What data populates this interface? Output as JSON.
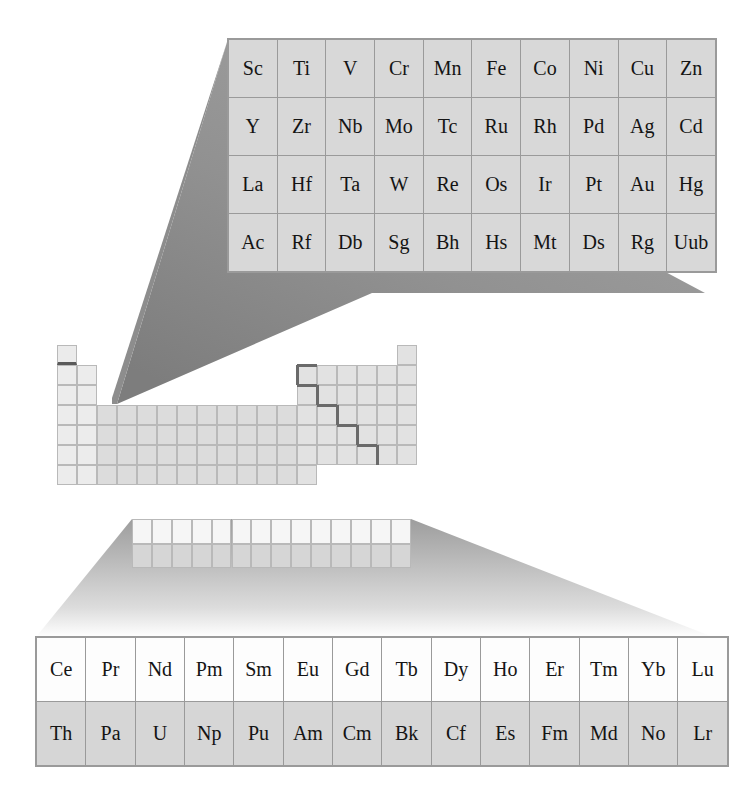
{
  "figure": {
    "kind": "periodic-table-callout-diagram",
    "background_color": "#ffffff",
    "cone_color_top": "#8d8d8d",
    "cone_color_bottom": "#b5b5b5",
    "cell_border_color": "#9a9a9a",
    "staircase_color": "#6a6a6a"
  },
  "dblock_panel": {
    "name": "transition-metals-callout",
    "columns": 10,
    "rows": 4,
    "cell_background": "#d8d8d8",
    "grid": [
      [
        "Sc",
        "Ti",
        "V",
        "Cr",
        "Mn",
        "Fe",
        "Co",
        "Ni",
        "Cu",
        "Zn"
      ],
      [
        "Y",
        "Zr",
        "Nb",
        "Mo",
        "Tc",
        "Ru",
        "Rh",
        "Pd",
        "Ag",
        "Cd"
      ],
      [
        "La",
        "Hf",
        "Ta",
        "W",
        "Re",
        "Os",
        "Ir",
        "Pt",
        "Au",
        "Hg"
      ],
      [
        "Ac",
        "Rf",
        "Db",
        "Sg",
        "Bh",
        "Hs",
        "Mt",
        "Ds",
        "Rg",
        "Uub"
      ]
    ]
  },
  "fblock_panel": {
    "name": "lanthanides-actinides-callout",
    "columns": 14,
    "rows": 2,
    "lanthanide_background": "#fdfdfd",
    "actinide_background": "#d6d6d6",
    "grid": [
      [
        "Ce",
        "Pr",
        "Nd",
        "Pm",
        "Sm",
        "Eu",
        "Gd",
        "Tb",
        "Dy",
        "Ho",
        "Er",
        "Tm",
        "Yb",
        "Lu"
      ],
      [
        "Th",
        "Pa",
        "U",
        "Np",
        "Pu",
        "Am",
        "Cm",
        "Bk",
        "Cf",
        "Es",
        "Fm",
        "Md",
        "No",
        "Lr"
      ]
    ]
  },
  "mini_table": {
    "name": "miniature-periodic-table",
    "cell_size_px": 20,
    "origin": {
      "x": 57,
      "y": 345
    },
    "blocks": {
      "s_block_note": "groups 1-2, periods 1-7; hydrogen cell carries a dark lower rule",
      "d_block_note": "groups 3-12, periods 4-7 (magnified above)",
      "p_block_note": "groups 13-18, periods 2-6 with metal/non-metal staircase",
      "f_block_note": "14-wide, 2-row strip detached below the main body (magnified below)"
    }
  }
}
